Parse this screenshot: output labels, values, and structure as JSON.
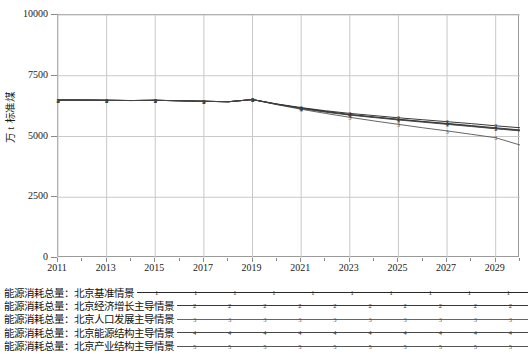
{
  "chart_data": {
    "type": "line",
    "title": "",
    "xlabel": "",
    "ylabel": "万 t 标准煤",
    "ylim": [
      0,
      10000
    ],
    "xlim": [
      2011,
      2030
    ],
    "yticks": [
      0,
      2500,
      5000,
      7500,
      10000
    ],
    "ytick_labels": [
      "0",
      "2500",
      "5000",
      "7500",
      "10000"
    ],
    "xticks": [
      2011,
      2013,
      2015,
      2017,
      2019,
      2021,
      2023,
      2025,
      2027,
      2029
    ],
    "xtick_labels": [
      "2011",
      "2013",
      "2015",
      "2017",
      "2019",
      "2021",
      "2023",
      "2025",
      "2027",
      "2029"
    ],
    "grid": true,
    "legend_position": "below",
    "x": [
      2011,
      2012,
      2013,
      2014,
      2015,
      2016,
      2017,
      2018,
      2019,
      2020,
      2021,
      2022,
      2023,
      2024,
      2025,
      2026,
      2027,
      2028,
      2029,
      2030
    ],
    "series": [
      {
        "name": "能源消耗总量：北京基准情景",
        "marker": "1",
        "color": "#111111",
        "values": [
          6500,
          6500,
          6490,
          6480,
          6490,
          6470,
          6450,
          6430,
          6520,
          6330,
          6170,
          6030,
          5900,
          5800,
          5700,
          5610,
          5520,
          5430,
          5330,
          5250
        ]
      },
      {
        "name": "能源消耗总量：北京经济增长主导情景",
        "marker": "2",
        "color": "#222222",
        "values": [
          6500,
          6500,
          6490,
          6480,
          6490,
          6470,
          6450,
          6430,
          6520,
          6340,
          6190,
          6060,
          5950,
          5860,
          5770,
          5690,
          5610,
          5530,
          5440,
          5360
        ]
      },
      {
        "name": "能源消耗总量：北京人口发展主导情景",
        "marker": "3",
        "color": "#555555",
        "values": [
          6500,
          6500,
          6490,
          6480,
          6490,
          6470,
          6450,
          6430,
          6520,
          6310,
          6120,
          5950,
          5790,
          5640,
          5500,
          5360,
          5230,
          5090,
          4950,
          4650
        ]
      },
      {
        "name": "能源消耗总量：北京能源结构主导情景",
        "marker": "4",
        "color": "#333333",
        "values": [
          6500,
          6500,
          6490,
          6480,
          6490,
          6470,
          6450,
          6430,
          6520,
          6330,
          6160,
          6020,
          5900,
          5800,
          5710,
          5620,
          5540,
          5450,
          5360,
          5270
        ]
      },
      {
        "name": "能源消耗总量：北京产业结构主导情景",
        "marker": "5",
        "color": "#444444",
        "values": [
          6500,
          6500,
          6490,
          6480,
          6490,
          6470,
          6450,
          6430,
          6520,
          6320,
          6150,
          6000,
          5880,
          5780,
          5680,
          5590,
          5500,
          5410,
          5320,
          5230
        ]
      }
    ]
  },
  "legend": {
    "entries": [
      {
        "label": "能源消耗总量：北京基准情景",
        "marker": "1"
      },
      {
        "label": "能源消耗总量：北京经济增长主导情景",
        "marker": "2"
      },
      {
        "label": "能源消耗总量：北京人口发展主导情景",
        "marker": "3"
      },
      {
        "label": "能源消耗总量：北京能源结构主导情景",
        "marker": "4"
      },
      {
        "label": "能源消耗总量：北京产业结构主导情景",
        "marker": "5"
      }
    ]
  }
}
